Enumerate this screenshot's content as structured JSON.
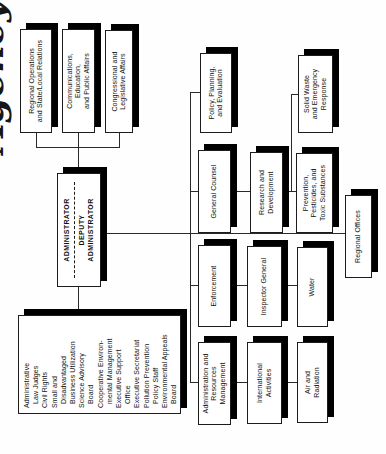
{
  "page": {
    "clipped_title": "Agency",
    "colors": {
      "ink": "#1c1c1c",
      "paper": "#ffffff",
      "shadow": "#000000"
    }
  },
  "org": {
    "administrator": {
      "title": "ADMINISTRATOR",
      "deputy": "DEPUTY\nADMINISTRATOR"
    },
    "staff_offices": [
      {
        "label": "Administrative\n  Law Judges"
      },
      {
        "label": "Civil Rights"
      },
      {
        "label": "Small and\n  Disadvantaged\n  Business Utilization"
      },
      {
        "label": "Science Advisory\n  Board"
      },
      {
        "label": "Cooperative Environ-\n  mental Management"
      },
      {
        "label": "Executive Support\n  Office"
      },
      {
        "label": "Executive Secretariat"
      },
      {
        "label": "Pollution Prevention\n  Policy Staff"
      },
      {
        "label": "Environmental Appeals\n  Board"
      }
    ],
    "offices": {
      "regional_operations": "Regional Operations\nand State/Local Relations",
      "communications": "Communications,\nEducation,\nand Public Affairs",
      "congressional": "Congressional and\nLegislative Affairs",
      "administration_resources": "Administration and\nResources\nManagement",
      "enforcement": "Enforcement",
      "general_counsel": "General Counsel",
      "policy_planning": "Policy, Planning,\nand Evaluation",
      "international": "International\nActivities",
      "inspector_general": "Inspector General",
      "research_development": "Research and\nDevelopment",
      "air_radiation": "Air and\nRadiation",
      "water": "Water",
      "prevention_pesticides": "Prevention,\nPesticides, and\nToxic Substances",
      "solid_waste": "Solid Waste\nand Emergency\nResponse",
      "regional_offices": "Regional Offices"
    }
  }
}
